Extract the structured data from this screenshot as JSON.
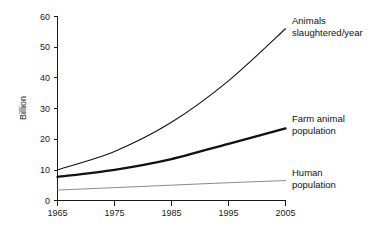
{
  "chart_data": {
    "type": "line",
    "title": "",
    "subtitle": "",
    "xlabel": "",
    "ylabel": "Billion",
    "x": [
      1965,
      1975,
      1985,
      1995,
      2005
    ],
    "xticklabels": [
      "1965",
      "1975",
      "1985",
      "1995",
      "2005"
    ],
    "xlim": [
      1965,
      2005
    ],
    "ylim": [
      0,
      60
    ],
    "yticks": [
      0,
      10,
      20,
      30,
      40,
      50,
      60
    ],
    "yticklabels": [
      "0",
      "10",
      "20",
      "30",
      "40",
      "50",
      "60"
    ],
    "grid": false,
    "legend_position": "inline-right-of-line-ends",
    "series": [
      {
        "name": "Animals slaughtered/year",
        "label_lines": [
          "Animals",
          "slaughtered/year"
        ],
        "values": [
          10,
          16,
          25.5,
          39,
          56
        ],
        "color": "#111111",
        "width": 1.1
      },
      {
        "name": "Farm animal population",
        "label_lines": [
          "Farm animal",
          "population"
        ],
        "values": [
          7.7,
          10,
          13.5,
          18.5,
          23.5
        ],
        "color": "#111111",
        "width": 2.3
      },
      {
        "name": "Human population",
        "label_lines": [
          "Human",
          "population"
        ],
        "values": [
          3.4,
          4.2,
          5,
          5.8,
          6.5
        ],
        "color": "#888888",
        "width": 1
      }
    ]
  },
  "axes": {
    "y_axis_title": "Billion"
  },
  "labels": {
    "slaughtered_line1": "Animals",
    "slaughtered_line2": "slaughtered/year",
    "farm_line1": "Farm animal",
    "farm_line2": "population",
    "human_line1": "Human",
    "human_line2": "population"
  },
  "yticks": {
    "t0": "0",
    "t10": "10",
    "t20": "20",
    "t30": "30",
    "t40": "40",
    "t50": "50",
    "t60": "60"
  },
  "xticks": {
    "t1965": "1965",
    "t1975": "1975",
    "t1985": "1985",
    "t1995": "1995",
    "t2005": "2005"
  }
}
